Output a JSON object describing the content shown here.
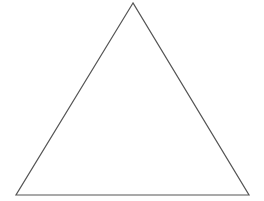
{
  "diagram": {
    "shape": "triangle",
    "type": "equilateral-outline",
    "vertices": [
      [
        133,
        3
      ],
      [
        16,
        195
      ],
      [
        249,
        195
      ]
    ],
    "stroke_color": "#555555",
    "fill_color": "#ffffff",
    "stroke_width": 1.2
  }
}
